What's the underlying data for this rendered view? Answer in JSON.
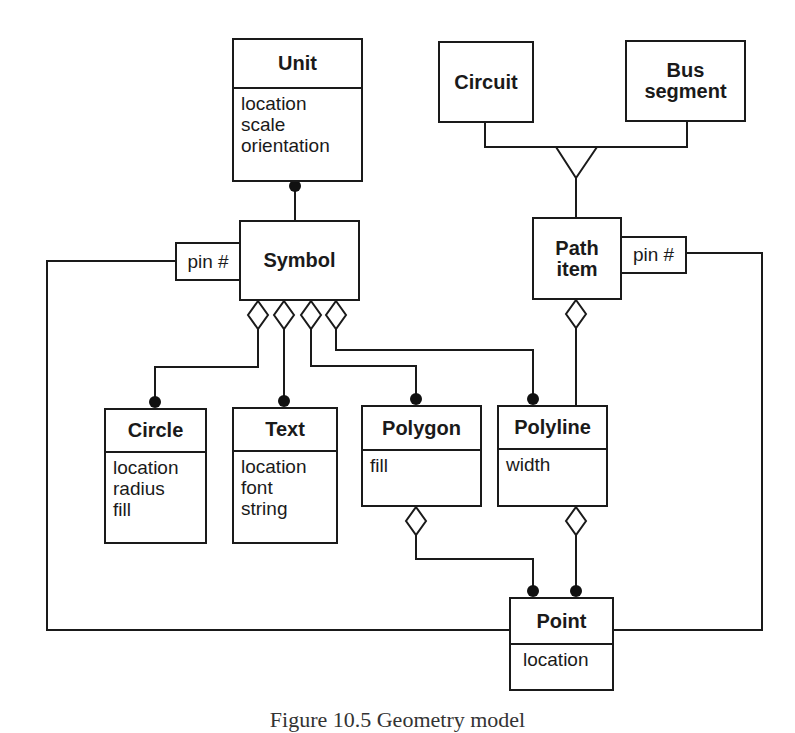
{
  "diagram": {
    "title": "Geometry model",
    "caption": "Figure 10.5 Geometry model",
    "classes": {
      "unit": {
        "name": "Unit",
        "attributes": [
          "location",
          "scale",
          "orientation"
        ]
      },
      "symbol": {
        "name": "Symbol",
        "qualifier": "pin #"
      },
      "circuit": {
        "name": "Circuit"
      },
      "bus_segment": {
        "name_line1": "Bus",
        "name_line2": "segment"
      },
      "path_item": {
        "name_line1": "Path",
        "name_line2": "item",
        "qualifier": "pin #"
      },
      "circle": {
        "name": "Circle",
        "attributes": [
          "location",
          "radius",
          "fill"
        ]
      },
      "text": {
        "name": "Text",
        "attributes": [
          "location",
          "font",
          "string"
        ]
      },
      "polygon": {
        "name": "Polygon",
        "attributes": [
          "fill"
        ]
      },
      "polyline": {
        "name": "Polyline",
        "attributes": [
          "width"
        ]
      },
      "point": {
        "name": "Point",
        "attributes": [
          "location"
        ]
      }
    },
    "relationships": [
      {
        "type": "association-many",
        "from": "Symbol",
        "to": "Unit"
      },
      {
        "type": "generalization",
        "parent": "Path item",
        "children": [
          "Circuit",
          "Bus segment"
        ]
      },
      {
        "type": "aggregation",
        "whole": "Symbol",
        "part": "Circle"
      },
      {
        "type": "aggregation",
        "whole": "Symbol",
        "part": "Text"
      },
      {
        "type": "aggregation",
        "whole": "Symbol",
        "part": "Polygon"
      },
      {
        "type": "aggregation",
        "whole": "Symbol",
        "part": "Polyline"
      },
      {
        "type": "aggregation",
        "whole": "Path item",
        "part": "Polyline"
      },
      {
        "type": "aggregation",
        "whole": "Polygon",
        "part": "Point"
      },
      {
        "type": "aggregation",
        "whole": "Polyline",
        "part": "Point"
      },
      {
        "type": "qualified-association",
        "from": "Symbol",
        "qualifier": "pin #",
        "to": "Point"
      },
      {
        "type": "qualified-association",
        "from": "Path item",
        "qualifier": "pin #",
        "to": "Point"
      }
    ],
    "colors": {
      "line": "#1a1a1a",
      "background": "#ffffff"
    }
  }
}
